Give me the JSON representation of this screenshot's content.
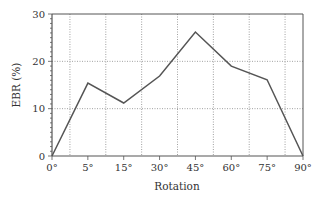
{
  "chart_data": {
    "type": "line",
    "title": "",
    "xlabel": "Rotation",
    "ylabel": "EBR (%)",
    "categories": [
      "0°",
      "5°",
      "15°",
      "30°",
      "45°",
      "60°",
      "75°",
      "90°"
    ],
    "series": [
      {
        "name": "EBR",
        "values": [
          0,
          15.4,
          11.2,
          16.9,
          26.2,
          19.0,
          16.1,
          0
        ]
      }
    ],
    "ylim": [
      0,
      30
    ],
    "yticks": [
      0,
      10,
      20,
      30
    ],
    "grid": true,
    "legend": "none"
  },
  "colors": {
    "line": "#555555",
    "axis": "#555555",
    "grid": "#888888"
  }
}
